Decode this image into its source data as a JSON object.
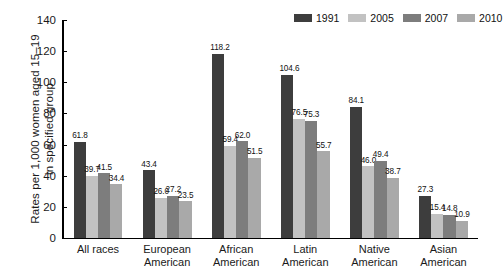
{
  "chart_data": {
    "type": "bar",
    "title": "",
    "subtitle": "",
    "xlabel": "",
    "ylabel_lines": [
      "Rates per 1,000 women aged 15–19",
      "in specified group"
    ],
    "ylabel": "Rates per 1,000 women aged 15–19 in specified group",
    "ylim": [
      0,
      140
    ],
    "yticks": [
      0,
      20,
      40,
      60,
      80,
      100,
      120,
      140
    ],
    "ytick_labels": [
      "0",
      "20",
      "40",
      "60",
      "80",
      "100",
      "120",
      "140"
    ],
    "grid": false,
    "legend_position": "top-right",
    "categories": [
      "All races",
      "European American",
      "African American",
      "Latin American",
      "Native American",
      "Asian American"
    ],
    "category_lines": [
      [
        "All races"
      ],
      [
        "European",
        "American"
      ],
      [
        "African",
        "American"
      ],
      [
        "Latin",
        "American"
      ],
      [
        "Native",
        "American"
      ],
      [
        "Asian",
        "American"
      ]
    ],
    "series": [
      {
        "name": "1991",
        "color": "#3d3d3d",
        "values": [
          61.8,
          43.4,
          118.2,
          104.6,
          84.1,
          27.3
        ],
        "labels": [
          "61.8",
          "43.4",
          "118.2",
          "104.6",
          "84.1",
          "27.3"
        ]
      },
      {
        "name": "2005",
        "color": "#c2c2c2",
        "values": [
          39.7,
          26.0,
          59.4,
          76.5,
          46.0,
          15.4
        ],
        "labels": [
          "39.7",
          "26.0",
          "59.4",
          "76.5",
          "46.0",
          "15.4"
        ]
      },
      {
        "name": "2007",
        "color": "#7d7d7d",
        "values": [
          41.5,
          27.2,
          62.0,
          75.3,
          49.4,
          14.8
        ],
        "labels": [
          "41.5",
          "27.2",
          "62.0",
          "75.3",
          "49.4",
          "14.8"
        ]
      },
      {
        "name": "2010",
        "color": "#a9a9a9",
        "values": [
          34.4,
          23.5,
          51.5,
          55.7,
          38.7,
          10.9
        ],
        "labels": [
          "34.4",
          "23.5",
          "51.5",
          "55.7",
          "38.7",
          "10.9"
        ]
      }
    ]
  }
}
